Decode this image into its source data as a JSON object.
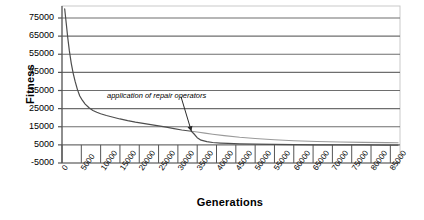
{
  "chart_data": {
    "type": "line",
    "title": "",
    "xlabel": "Generations",
    "ylabel": "Fitness",
    "xlim": [
      0,
      87500
    ],
    "ylim": [
      -5000,
      80000
    ],
    "grid": true,
    "legend": null,
    "x_ticks": [
      0,
      5000,
      10000,
      15000,
      20000,
      25000,
      30000,
      35000,
      40000,
      45000,
      50000,
      55000,
      60000,
      65000,
      70000,
      75000,
      80000,
      85000
    ],
    "x_tick_labels": [
      "0",
      "5000",
      "10000",
      "15000",
      "20000",
      "25000",
      "30000",
      "35000",
      "40000",
      "45000",
      "50000",
      "55000",
      "60000",
      "65000",
      "70000",
      "75000",
      "80000",
      "85000"
    ],
    "y_ticks": [
      -5000,
      5000,
      15000,
      25000,
      35000,
      45000,
      55000,
      65000,
      75000
    ],
    "y_tick_labels": [
      "-5000",
      "5000",
      "15000",
      "25000",
      "35000",
      "45000",
      "55000",
      "65000",
      "75000"
    ],
    "annotations": [
      {
        "text": "application of repair operators",
        "x": 22000,
        "y": 30500,
        "arrow_to_x": 33500,
        "arrow_to_y": 12500
      }
    ],
    "series": [
      {
        "name": "best fitness",
        "x": [
          700,
          1100,
          1500,
          1900,
          2400,
          2900,
          3400,
          4000,
          4600,
          5300,
          6000,
          7000,
          8000,
          9000,
          10000,
          11500,
          13000,
          15000,
          17000,
          19000,
          21000,
          23000,
          25000,
          27000,
          29000,
          31000,
          32500,
          33500,
          34200,
          35000,
          36000,
          37500,
          39000,
          41000,
          43000,
          46000,
          50000,
          55000,
          60000,
          66000,
          72000,
          78000,
          84000,
          87000
        ],
        "y": [
          80000,
          72000,
          64000,
          57000,
          50000,
          44500,
          40000,
          35500,
          32000,
          29500,
          27500,
          25500,
          24000,
          23000,
          22200,
          21200,
          20400,
          19300,
          18400,
          17600,
          16900,
          16200,
          15500,
          14800,
          14000,
          13200,
          12800,
          12500,
          11000,
          9000,
          7600,
          6800,
          6300,
          6000,
          5800,
          5600,
          5400,
          5250,
          5150,
          5050,
          5000,
          4950,
          4900,
          4880
        ]
      },
      {
        "name": "average fitness",
        "x": [
          33500,
          35000,
          37000,
          39000,
          42000,
          46000,
          50000,
          55000,
          60000,
          66000,
          72000,
          78000,
          84000,
          87000
        ],
        "y": [
          12500,
          12100,
          11500,
          10900,
          10100,
          9200,
          8500,
          7800,
          7300,
          6900,
          6600,
          6400,
          6250,
          6200
        ]
      }
    ]
  },
  "colors": {
    "curve_primary": "#4d4d4d",
    "curve_secondary": "#9a9a9a",
    "gridline": "#6e6e6e",
    "axis": "#555555",
    "frame": "#c9c9c9",
    "text": "#000000"
  }
}
